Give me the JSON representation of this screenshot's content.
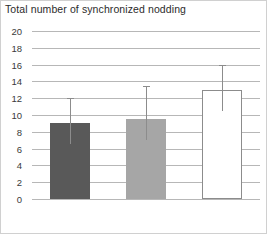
{
  "chart_data": {
    "type": "bar",
    "title": "Total number of synchronized nodding",
    "xlabel": "",
    "ylabel": "",
    "categories": [
      "Low",
      "Middle",
      "High"
    ],
    "values": [
      9.0,
      9.5,
      13.0
    ],
    "error_low": [
      6.5,
      7.0,
      10.5
    ],
    "error_high": [
      12.0,
      13.5,
      16.0
    ],
    "ylim": [
      0,
      20
    ],
    "ytick_step": 2,
    "yticks": [
      0,
      2,
      4,
      6,
      8,
      10,
      12,
      14,
      16,
      18,
      20
    ],
    "ytick_labels": [
      "0",
      "2",
      "4",
      "6",
      "8",
      "10",
      "12",
      "14",
      "16",
      "18",
      "20"
    ],
    "grid": true,
    "legend": false,
    "bar_colors": [
      "#595959",
      "#a6a6a6",
      "#ffffff"
    ],
    "bar_edge_colors": [
      "#595959",
      "#a6a6a6",
      "#8c8c8c"
    ],
    "error_color": "#8c8c8c",
    "gridline_color": "#b7b7b7",
    "border_color": "#d0d0d0"
  }
}
